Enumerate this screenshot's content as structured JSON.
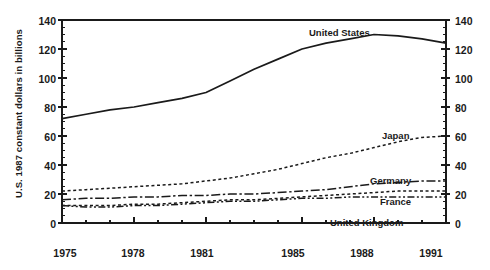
{
  "chart_data": {
    "type": "line",
    "title": "",
    "xlabel": "",
    "ylabel": "U.S. 1987 constant dollars in billions",
    "xlim": [
      1975,
      1991
    ],
    "ylim": [
      0,
      140
    ],
    "grid": false,
    "legend": "inline end-of-line labels",
    "dual_y_axis": true,
    "x": [
      1975,
      1976,
      1977,
      1978,
      1979,
      1980,
      1981,
      1982,
      1983,
      1984,
      1985,
      1986,
      1987,
      1988,
      1989,
      1990,
      1991
    ],
    "xticks": [
      1975,
      1978,
      1981,
      1985,
      1988,
      1991
    ],
    "yticks": [
      0,
      20,
      40,
      60,
      80,
      100,
      120,
      140
    ],
    "yticks_minor_step": 5,
    "series": [
      {
        "name": "United States",
        "style": "solid",
        "values": [
          72,
          75,
          78,
          80,
          83,
          86,
          90,
          98,
          106,
          113,
          120,
          124,
          127,
          130,
          129,
          127,
          124
        ]
      },
      {
        "name": "Japan",
        "style": "dotted",
        "values": [
          22,
          23,
          24,
          25,
          26,
          27,
          29,
          31,
          34,
          37,
          41,
          45,
          48,
          52,
          56,
          59,
          60
        ]
      },
      {
        "name": "Germany",
        "style": "dash-dot",
        "values": [
          16,
          17,
          17,
          18,
          18,
          19,
          19,
          20,
          20,
          21,
          22,
          23,
          25,
          27,
          28,
          29,
          29
        ]
      },
      {
        "name": "France",
        "style": "dotted",
        "values": [
          12,
          12,
          12,
          13,
          13,
          14,
          15,
          16,
          16,
          17,
          18,
          19,
          20,
          21,
          22,
          22,
          22
        ]
      },
      {
        "name": "United Kingdom",
        "style": "dash-dot-dot",
        "values": [
          12,
          11,
          11,
          12,
          12,
          13,
          14,
          15,
          15,
          16,
          17,
          17,
          18,
          18,
          18,
          18,
          18
        ]
      }
    ]
  },
  "axes": {
    "y_left_labels": [
      "140",
      "120",
      "100",
      "80",
      "60",
      "40",
      "20",
      "0"
    ],
    "y_right_labels": [
      "140",
      "120",
      "100",
      "80",
      "60",
      "40",
      "20",
      "0"
    ],
    "x_labels": [
      "1975",
      "1978",
      "1981",
      "1985",
      "1988",
      "1991"
    ]
  },
  "series_labels": {
    "united_states": "United States",
    "japan": "Japan",
    "germany": "Germany",
    "france": "France",
    "united_kingdom": "United Kingdom"
  },
  "colors": {
    "ink": "#1a1a1a",
    "background": "#ffffff"
  }
}
